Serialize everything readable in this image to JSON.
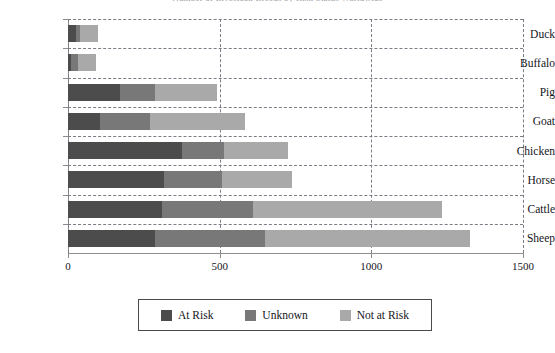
{
  "chart_data": {
    "type": "bar",
    "orientation": "horizontal",
    "stacked": true,
    "title": "Number of Livestock Breeds by Risk Status Worldwide",
    "xlabel": "",
    "ylabel": "",
    "categories": [
      "Duck",
      "Buffalo",
      "Pig",
      "Goat",
      "Chicken",
      "Horse",
      "Cattle",
      "Sheep"
    ],
    "series": [
      {
        "name": "At Risk",
        "color": "#4c4c4c",
        "values": [
          26,
          10,
          171,
          105,
          375,
          316,
          309,
          287
        ]
      },
      {
        "name": "Unknown",
        "color": "#787878",
        "values": [
          13,
          23,
          115,
          164,
          138,
          191,
          300,
          363
        ]
      },
      {
        "name": "Not at Risk",
        "color": "#a9a9a9",
        "values": [
          59,
          59,
          204,
          313,
          211,
          233,
          624,
          675
        ]
      }
    ],
    "totals": [
      98,
      92,
      490,
      582,
      724,
      740,
      1233,
      1325
    ],
    "xlim": [
      0,
      1500
    ],
    "xticks": [
      0,
      500,
      1000,
      1500
    ],
    "xtick_labels": [
      "0",
      "500",
      "1000",
      "1500"
    ],
    "grid": {
      "vertical": true,
      "horizontal": true,
      "style": "dashed"
    },
    "legend": {
      "position": "bottom",
      "boxed": true
    }
  },
  "legend": {
    "items": [
      {
        "label": "At Risk"
      },
      {
        "label": "Unknown"
      },
      {
        "label": "Not at Risk"
      }
    ]
  },
  "colors": {
    "at_risk": "#4c4c4c",
    "unknown": "#787878",
    "not_at_risk": "#a9a9a9",
    "axis": "#8d8d8d",
    "grid": "#7c7c86",
    "text": "#15151a",
    "legend_border": "#4a4a4a",
    "background": "#ffffff"
  }
}
